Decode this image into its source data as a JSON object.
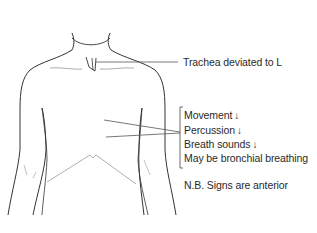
{
  "diagram": {
    "labels": {
      "trachea": "Trachea deviated to L",
      "signs": [
        {
          "text": "Movement",
          "arrow": "↓"
        },
        {
          "text": "Percussion",
          "arrow": "↓"
        },
        {
          "text": "Breath sounds",
          "arrow": "↓"
        },
        {
          "text": "May be bronchial breathing",
          "arrow": ""
        }
      ],
      "note": "N.B. Signs are anterior"
    },
    "colors": {
      "outline": "#333333",
      "leader": "#555555",
      "fissure": "#999999",
      "text": "#2a2a2a"
    }
  }
}
